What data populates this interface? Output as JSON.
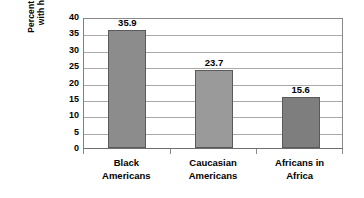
{
  "chart_data": {
    "type": "bar",
    "title": "",
    "xlabel": "",
    "ylabel": "Percent of population with hypertension",
    "ylabel_lines": [
      "Percent of population",
      "with hypertension"
    ],
    "categories": [
      "Black Americans",
      "Caucasian Americans",
      "Africans in Africa"
    ],
    "category_lines": [
      [
        "Black",
        "Americans"
      ],
      [
        "Caucasian",
        "Americans"
      ],
      [
        "Africans in",
        "Africa"
      ]
    ],
    "values": [
      35.9,
      23.7,
      15.6
    ],
    "data_labels": [
      "35.9",
      "23.7",
      "15.6"
    ],
    "ylim": [
      0,
      40
    ],
    "yticks": [
      40,
      35,
      30,
      25,
      20,
      15,
      10,
      5,
      0
    ],
    "ytick_labels": [
      "40",
      "35",
      "30",
      "25",
      "20",
      "15",
      "10",
      "5",
      "0"
    ],
    "grid": true,
    "grid_axis": "y",
    "legend": false,
    "legend_position": "none",
    "bar_colors": [
      "#8c8c8c",
      "#9a9a9a",
      "#7e7e7e"
    ],
    "bar_border_color": "#5a5a5a",
    "gridline_color": "#a9a9a9",
    "plot_border_color": "#8a8a8a",
    "background_color": "#ffffff",
    "text_color": "#000000"
  }
}
